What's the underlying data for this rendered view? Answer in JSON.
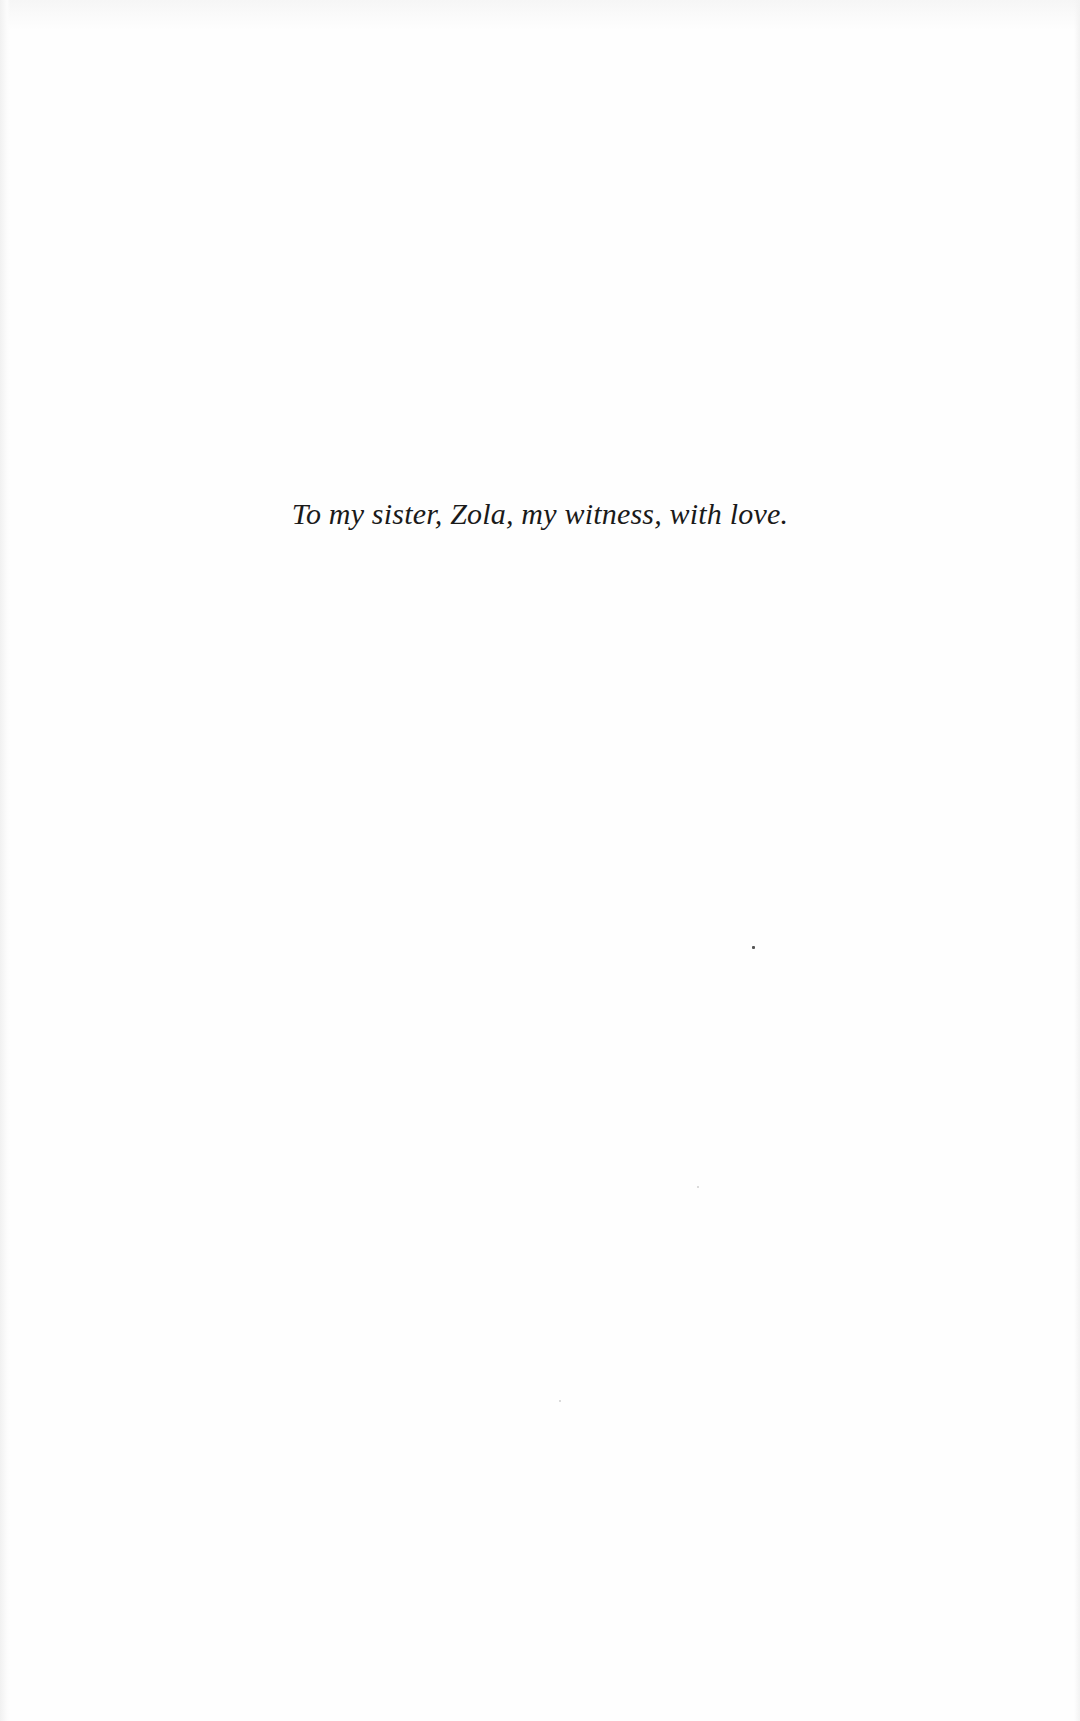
{
  "document": {
    "type": "dedication-page",
    "dedication_text": "To my sister, Zola, my witness, with love."
  },
  "colors": {
    "background": "#fefefe",
    "text": "#1a1a1a"
  }
}
